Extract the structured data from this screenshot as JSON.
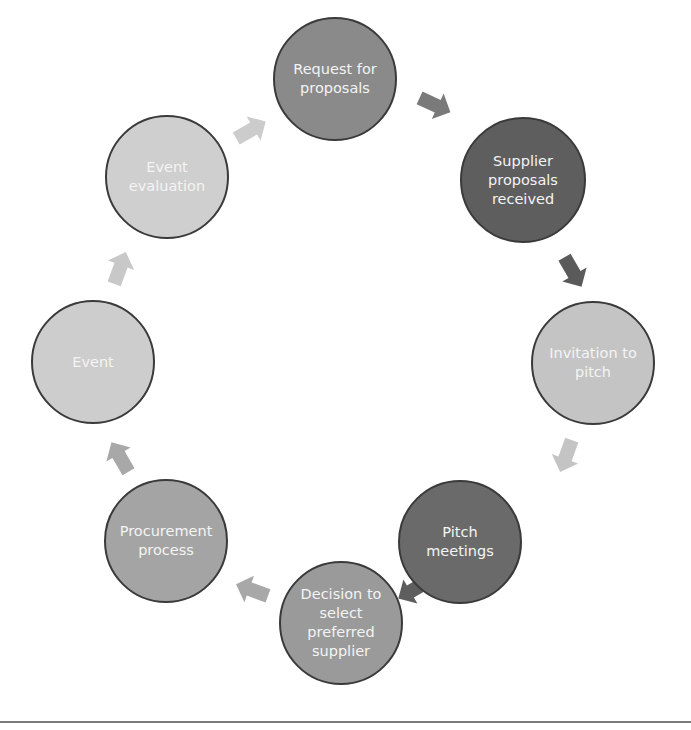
{
  "diagram": {
    "type": "cycle",
    "nodes": [
      {
        "id": "request",
        "label": "Request for\nproposals",
        "cx": 335,
        "cy": 79,
        "r": 62,
        "fill": "#8a8a8a"
      },
      {
        "id": "supplier",
        "label": "Supplier\nproposals\nreceived",
        "cx": 523,
        "cy": 180,
        "r": 63,
        "fill": "#5e5e5e"
      },
      {
        "id": "invitation",
        "label": "Invitation to\npitch",
        "cx": 593,
        "cy": 363,
        "r": 62,
        "fill": "#c4c4c4"
      },
      {
        "id": "pitch",
        "label": "Pitch\nmeetings",
        "cx": 460,
        "cy": 542,
        "r": 62,
        "fill": "#6a6a6a"
      },
      {
        "id": "decision",
        "label": "Decision to\nselect\npreferred\nsupplier",
        "cx": 341,
        "cy": 623,
        "r": 62,
        "fill": "#9a9a9a"
      },
      {
        "id": "procurement",
        "label": "Procurement\nprocess",
        "cx": 166,
        "cy": 541,
        "r": 62,
        "fill": "#a4a4a4"
      },
      {
        "id": "event",
        "label": "Event",
        "cx": 93,
        "cy": 362,
        "r": 62,
        "fill": "#cdcdcd"
      },
      {
        "id": "evaluation",
        "label": "Event\nevaluation",
        "cx": 167,
        "cy": 177,
        "r": 62,
        "fill": "#cfcfcf"
      }
    ],
    "arrows": [
      {
        "from": "request",
        "to": "supplier",
        "x": 435,
        "y": 105,
        "angle": 25,
        "fill": "#7a7a7a"
      },
      {
        "from": "supplier",
        "to": "invitation",
        "x": 573,
        "y": 272,
        "angle": 60,
        "fill": "#5a5a5a"
      },
      {
        "from": "invitation",
        "to": "pitch",
        "x": 566,
        "y": 456,
        "angle": 110,
        "fill": "#c4c4c4"
      },
      {
        "from": "pitch",
        "to": "decision",
        "x": 413,
        "y": 590,
        "angle": 150,
        "fill": "#5e5e5e"
      },
      {
        "from": "decision",
        "to": "procurement",
        "x": 252,
        "y": 590,
        "angle": 200,
        "fill": "#a8a8a8"
      },
      {
        "from": "procurement",
        "to": "event",
        "x": 120,
        "y": 457,
        "angle": 240,
        "fill": "#a8a8a8"
      },
      {
        "from": "event",
        "to": "evaluation",
        "x": 120,
        "y": 268,
        "angle": 290,
        "fill": "#c8c8c8"
      },
      {
        "from": "evaluation",
        "to": "request",
        "x": 251,
        "y": 130,
        "angle": 330,
        "fill": "#cccccc"
      }
    ]
  }
}
